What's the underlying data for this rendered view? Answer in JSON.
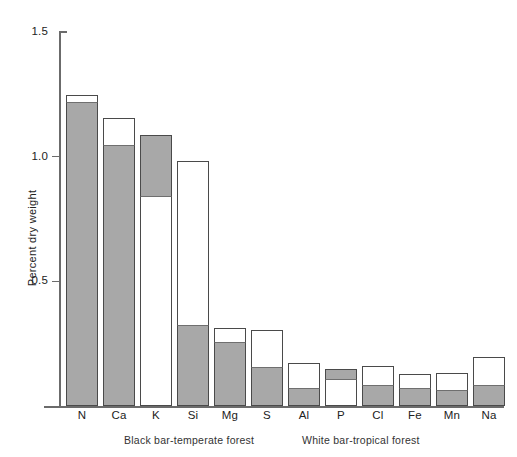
{
  "chart_data": {
    "type": "bar",
    "title": "",
    "subtitle": "",
    "xlabel": "",
    "ylabel": "Percent dry weight",
    "ylim": [
      0,
      1.5
    ],
    "yticks": [
      0.5,
      1.0,
      1.5
    ],
    "ytick_labels": [
      "0.5",
      "1.0",
      "1.5"
    ],
    "grid": false,
    "legend_position": "below-axis",
    "categories": [
      "N",
      "Ca",
      "K",
      "Si",
      "Mg",
      "S",
      "Al",
      "P",
      "Cl",
      "Fe",
      "Mn",
      "Na"
    ],
    "series": [
      {
        "name": "Black bar-temperate forest",
        "color": "#a8a8a8",
        "values": [
          1.22,
          1.05,
          1.09,
          0.33,
          0.26,
          0.16,
          0.07,
          0.15,
          0.08,
          0.07,
          0.06,
          0.08
        ]
      },
      {
        "name": "White bar-tropical forest",
        "color": "#ffffff",
        "values": [
          1.25,
          1.16,
          1.09,
          0.98,
          0.31,
          0.31,
          0.17,
          0.1,
          0.16,
          0.13,
          0.13,
          0.2
        ]
      }
    ],
    "bars": [
      {
        "label": "N",
        "outline_top": 1.247,
        "fill_top": 1.219,
        "fill_bottom": 0.0,
        "fill_anchor": "bottom"
      },
      {
        "label": "Ca",
        "outline_top": 1.155,
        "fill_top": 1.047,
        "fill_bottom": 0.0,
        "fill_anchor": "bottom"
      },
      {
        "label": "K",
        "outline_top": 1.087,
        "fill_top": 1.087,
        "fill_bottom": 0.838,
        "fill_anchor": "top"
      },
      {
        "label": "Si",
        "outline_top": 0.983,
        "fill_top": 0.325,
        "fill_bottom": 0.0,
        "fill_anchor": "bottom"
      },
      {
        "label": "Mg",
        "outline_top": 0.313,
        "fill_top": 0.257,
        "fill_bottom": 0.0,
        "fill_anchor": "bottom"
      },
      {
        "label": "S",
        "outline_top": 0.305,
        "fill_top": 0.156,
        "fill_bottom": 0.0,
        "fill_anchor": "bottom"
      },
      {
        "label": "Al",
        "outline_top": 0.172,
        "fill_top": 0.072,
        "fill_bottom": 0.0,
        "fill_anchor": "bottom"
      },
      {
        "label": "P",
        "outline_top": 0.148,
        "fill_top": 0.148,
        "fill_bottom": 0.104,
        "fill_anchor": "top"
      },
      {
        "label": "Cl",
        "outline_top": 0.16,
        "fill_top": 0.084,
        "fill_bottom": 0.0,
        "fill_anchor": "bottom"
      },
      {
        "label": "Fe",
        "outline_top": 0.128,
        "fill_top": 0.072,
        "fill_bottom": 0.0,
        "fill_anchor": "bottom"
      },
      {
        "label": "Mn",
        "outline_top": 0.132,
        "fill_top": 0.064,
        "fill_bottom": 0.0,
        "fill_anchor": "bottom"
      },
      {
        "label": "Na",
        "outline_top": 0.196,
        "fill_top": 0.084,
        "fill_bottom": 0.0,
        "fill_anchor": "bottom"
      }
    ]
  },
  "axis": {
    "y_title": "Percent dry weight",
    "ticks": [
      {
        "value": 1.5,
        "label": "1.5"
      },
      {
        "value": 1.0,
        "label": "1.0"
      },
      {
        "value": 0.5,
        "label": "0.5"
      }
    ]
  },
  "legend": {
    "black_bar": "Black bar-temperate forest",
    "white_bar": "White bar-tropical forest"
  },
  "colors": {
    "fill_gray": "#a8a8a8",
    "outline": "#4a4a4a",
    "axis": "#6b6b6b",
    "background": "#ffffff",
    "text": "#222222"
  }
}
